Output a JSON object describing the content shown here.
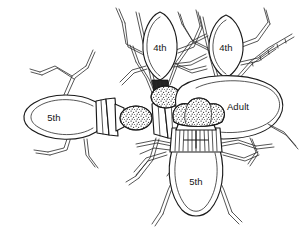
{
  "figure": {
    "background_color": "#ffffff",
    "ink_color": "#1a1a1a",
    "width": 303,
    "height": 238,
    "style": "black-and-white scientific line illustration, stippled egg masses"
  },
  "labels": {
    "nymph_left": "5th",
    "nymph_upper_left": "4th",
    "nymph_upper_right": "4th",
    "adult": "Adult",
    "nymph_bottom": "5th"
  },
  "specimens": [
    {
      "id": "specimen-left",
      "label": "5th",
      "orientation": "facing-right",
      "position": "left",
      "has_egg_mass": true
    },
    {
      "id": "specimen-upper-left",
      "label": "4th",
      "orientation": "facing-down",
      "position": "upper-left-center",
      "has_egg_mass": true
    },
    {
      "id": "specimen-upper-right",
      "label": "4th",
      "orientation": "facing-down",
      "position": "upper-right",
      "has_egg_mass": true
    },
    {
      "id": "specimen-adult",
      "label": "Adult",
      "orientation": "facing-left",
      "position": "right",
      "has_egg_mass": true
    },
    {
      "id": "specimen-bottom",
      "label": "5th",
      "orientation": "facing-up",
      "position": "bottom-center",
      "has_egg_mass": true
    }
  ],
  "caption": {
    "partial_text": ""
  }
}
